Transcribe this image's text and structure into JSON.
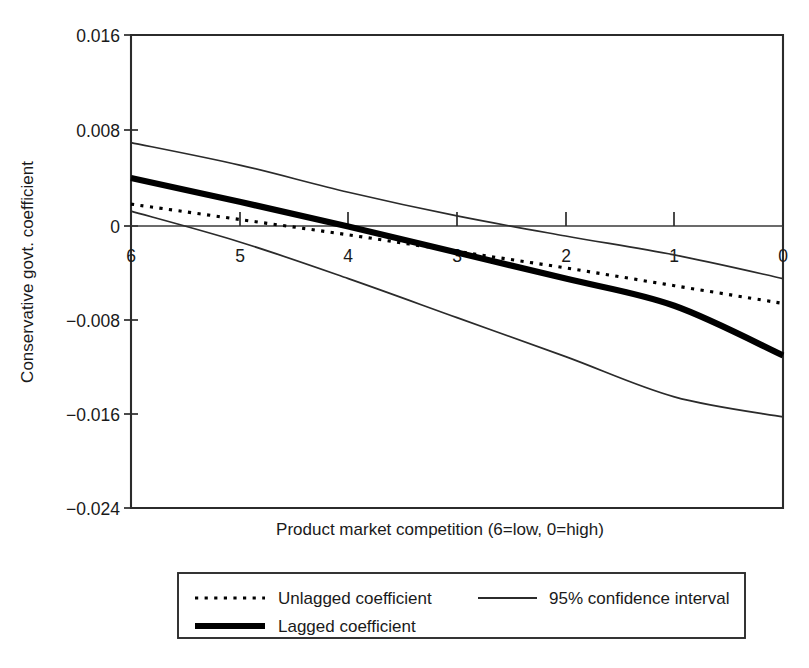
{
  "chart_data": {
    "type": "line",
    "title": "",
    "xlabel": "Product market competition (6=low, 0=high)",
    "ylabel": "Conservative govt. coefficient",
    "xlim": [
      6,
      0
    ],
    "ylim": [
      -0.024,
      0.016
    ],
    "x_ticks": [
      "6",
      "5",
      "4",
      "3",
      "2",
      "1",
      "0"
    ],
    "x_tick_values": [
      6,
      5,
      4,
      3,
      2,
      1,
      0
    ],
    "y_ticks": [
      "0.016",
      "0.008",
      "0",
      "−0.008",
      "−0.016",
      "−0.024"
    ],
    "y_tick_values": [
      0.016,
      0.008,
      0,
      -0.008,
      -0.016,
      -0.024
    ],
    "x_axis_reversed": true,
    "grid": false,
    "zero_reference_line": true,
    "legend_position": "below-plot",
    "series": [
      {
        "name": "Unlagged coefficient",
        "style": "dotted",
        "x": [
          6,
          5,
          4,
          3,
          2,
          1,
          0
        ],
        "values": [
          0.0017,
          0.0004,
          -0.0009,
          -0.0023,
          -0.0037,
          -0.0052,
          -0.0067
        ]
      },
      {
        "name": "Lagged coefficient",
        "style": "thick-solid",
        "x": [
          6,
          5,
          4,
          3,
          2,
          1,
          0
        ],
        "values": [
          0.0039,
          0.0019,
          -0.0002,
          -0.0024,
          -0.0046,
          -0.0069,
          -0.0111
        ]
      },
      {
        "name": "95% confidence interval",
        "style": "thin-solid",
        "bound": "upper",
        "x": [
          6,
          5,
          4,
          3,
          2,
          1,
          0
        ],
        "values": [
          0.0069,
          0.005,
          0.0027,
          0.0007,
          -0.001,
          -0.0026,
          -0.0046
        ]
      },
      {
        "name": "95% confidence interval",
        "style": "thin-solid",
        "bound": "lower",
        "x": [
          6,
          5,
          4,
          3,
          2,
          1,
          0
        ],
        "values": [
          0.0011,
          -0.0015,
          -0.0046,
          -0.0079,
          -0.0112,
          -0.0146,
          -0.0163
        ]
      }
    ]
  },
  "legend": {
    "items": [
      {
        "label": "Unlagged coefficient",
        "marker": "dotted-line-icon"
      },
      {
        "label": "95% confidence interval",
        "marker": "thin-line-icon"
      },
      {
        "label": "Lagged coefficient",
        "marker": "thick-line-icon"
      }
    ]
  },
  "axes": {
    "y_title": "Conservative govt. coefficient",
    "x_title": "Product market competition (6=low, 0=high)",
    "y_tick_labels": [
      "0.016",
      "0.008",
      "0",
      "−0.008",
      "−0.016",
      "−0.024"
    ],
    "x_tick_labels": [
      "6",
      "5",
      "4",
      "3",
      "2",
      "1",
      "0"
    ]
  },
  "colors": {
    "background": "#ffffff",
    "ink": "#1a1a1a",
    "frame": "#2b2b2b",
    "line": "#000000"
  }
}
